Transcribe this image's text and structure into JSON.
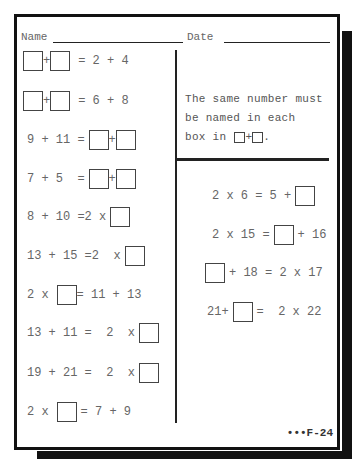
{
  "header": {
    "name_label": "Name",
    "date_label": "Date"
  },
  "instructions": {
    "line1": "The same number must",
    "line2": "be named in each",
    "line3_prefix": "box in",
    "line3_op": "+",
    "line3_suffix": "."
  },
  "left_problems": [
    {
      "a": "",
      "op": "+",
      "b": "",
      "rhs": "= 2 + 4"
    },
    {
      "a": "",
      "op": "+",
      "b": "",
      "rhs": "= 6 + 8"
    },
    {
      "lhs": "9 + 11 =",
      "op": "+"
    },
    {
      "lhs": "7 + 5  =",
      "op": "+"
    },
    {
      "lhs": "8 + 10 =2 x"
    },
    {
      "lhs": "13 + 15 =2  x"
    },
    {
      "pre": "2 x",
      "post": "= 11 + 13"
    },
    {
      "lhs": "13 + 11 =  2  x"
    },
    {
      "lhs": "19 + 21 =  2  x"
    },
    {
      "pre": "2 x",
      "post": "= 7 + 9"
    }
  ],
  "right_problems": [
    {
      "pre": "2 x 6 = 5 +",
      "post": ""
    },
    {
      "pre": "2 x 15 =",
      "post": "+ 16"
    },
    {
      "pre": "",
      "post": "+ 18 = 2 x 17"
    },
    {
      "pre": "21+",
      "post": "=  2 x 22"
    }
  ],
  "footer": {
    "page_code": "•••F-24"
  }
}
